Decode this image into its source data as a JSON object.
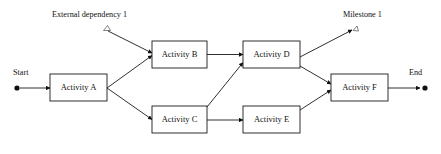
{
  "diagram": {
    "title_labels": {
      "start": "Start",
      "end": "End",
      "external_dependency": "External dependency 1",
      "milestone": "Milestone 1"
    },
    "nodes": [
      {
        "id": "activity-a",
        "label": "Activity A"
      },
      {
        "id": "activity-b",
        "label": "Activity B"
      },
      {
        "id": "activity-c",
        "label": "Activity C"
      },
      {
        "id": "activity-d",
        "label": "Activity D"
      },
      {
        "id": "activity-e",
        "label": "Activity E"
      },
      {
        "id": "activity-f",
        "label": "Activity F"
      }
    ],
    "edges": [
      {
        "from": "start",
        "to": "activity-a"
      },
      {
        "from": "activity-a",
        "to": "activity-b"
      },
      {
        "from": "activity-a",
        "to": "activity-c"
      },
      {
        "from": "external-dependency-1",
        "to": "activity-b"
      },
      {
        "from": "activity-b",
        "to": "activity-d"
      },
      {
        "from": "activity-c",
        "to": "activity-d"
      },
      {
        "from": "activity-c",
        "to": "activity-e"
      },
      {
        "from": "activity-d",
        "to": "milestone-1"
      },
      {
        "from": "activity-d",
        "to": "activity-f"
      },
      {
        "from": "activity-e",
        "to": "activity-f"
      },
      {
        "from": "activity-f",
        "to": "end"
      }
    ],
    "colors": {
      "stroke": "#1a1a1a",
      "text": "#111111",
      "background": "#ffffff",
      "marker": "#4a4a4a"
    }
  }
}
